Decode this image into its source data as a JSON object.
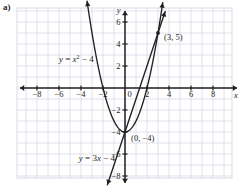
{
  "figure": {
    "part_label": "a)",
    "background": "#ffffff",
    "grid_color": "#d8d5e4",
    "axis_color": "#231f20",
    "curve_color": "#231f20"
  },
  "chart_data": {
    "type": "line",
    "title": "",
    "xlabel": "x",
    "ylabel": "y",
    "xlim": [
      -9.8,
      9.8
    ],
    "ylim": [
      -8.9,
      7.2
    ],
    "grid": true,
    "grid_step": 1,
    "x_ticks": [
      -8,
      -6,
      -4,
      -2,
      0,
      2,
      4,
      6,
      8
    ],
    "x_tick_labels": [
      "−8",
      "−6",
      "−4",
      "−2",
      "0",
      "2",
      "4",
      "6",
      "8"
    ],
    "y_ticks": [
      -8,
      -6,
      -4,
      -2,
      2,
      4,
      6
    ],
    "y_tick_labels": [
      "−8",
      "−6",
      "−4",
      "−2",
      "2",
      "4",
      "6"
    ],
    "origin_label": "0",
    "series": [
      {
        "name": "y = x² − 4",
        "equation_parts": {
          "lhs": "y",
          "eq": " = ",
          "var": "x",
          "exp": "2",
          "rest": " − 4"
        },
        "type": "parabola",
        "a": 1,
        "b": 0,
        "c": -4,
        "label": "y = x² − 4",
        "label_x": -6.0,
        "label_y": 2.6,
        "domain": [
          -3.45,
          3.45
        ]
      },
      {
        "name": "y = 3x − 4",
        "equation_parts": {
          "lhs": "y",
          "eq": " = ",
          "coef": "3",
          "var": "x",
          "rest": " − 4"
        },
        "type": "linear",
        "slope": 3,
        "intercept": -4,
        "label": "y = 3x − 4",
        "label_x": -4.2,
        "label_y": -6.4,
        "domain": [
          -1.6,
          3.65
        ]
      }
    ],
    "points": [
      {
        "label": "(3, 5)",
        "x": 3,
        "y": 5,
        "label_offset_x": 0.55,
        "label_offset_y": -0.35
      },
      {
        "label": "(0, −4)",
        "x": 0,
        "y": -4,
        "label_offset_x": 0.55,
        "label_offset_y": -0.55
      }
    ],
    "annotations": []
  }
}
